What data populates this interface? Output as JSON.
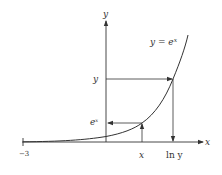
{
  "figure": {
    "curve_label": "y = e",
    "curve_label_sup": "x",
    "axis_x_label": "x",
    "axis_y_label": "y",
    "tick_label_neg3": "−3",
    "point_labels": {
      "x_on_axis": "x",
      "ln_y": "ln y",
      "y_on_axis": "y",
      "ex_base": "e",
      "ex_sup": "x"
    },
    "colors": {
      "ink": "#333333",
      "background": "#ffffff"
    },
    "caption_faint": ""
  }
}
